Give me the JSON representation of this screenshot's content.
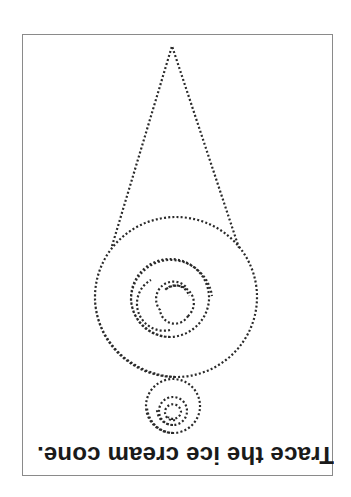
{
  "worksheet": {
    "instruction": "Trace the ice cream cone.",
    "orientation": "upside-down",
    "line_style": "dotted",
    "colors": {
      "ink": "#2a2a2a",
      "border": "#8a8a8a",
      "background": "#ffffff"
    }
  },
  "figure": {
    "shapes": [
      "cone-triangle",
      "large-scoop-spiral",
      "small-scoop-spiral"
    ]
  }
}
